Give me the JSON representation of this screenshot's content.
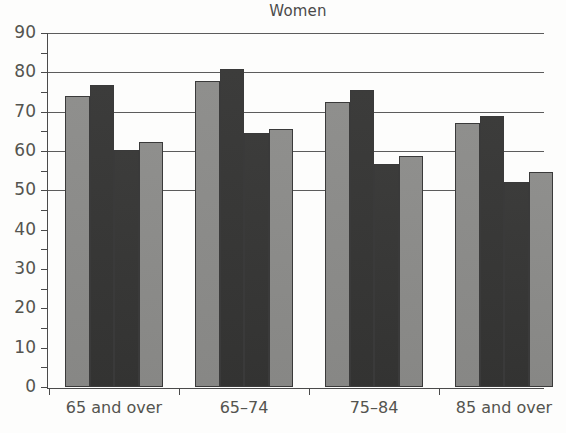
{
  "chart_data": {
    "type": "bar",
    "title": "Women",
    "xlabel": "",
    "ylabel": "",
    "ylim": [
      0,
      90
    ],
    "ytick_values": [
      0,
      10,
      20,
      30,
      40,
      50,
      60,
      70,
      80,
      90
    ],
    "ytick_labels": [
      "0",
      "10",
      "20",
      "30",
      "40",
      "50",
      "60",
      "70",
      "80",
      "90"
    ],
    "yminor_values": [
      5,
      15,
      25,
      35,
      45,
      55,
      65,
      75,
      85
    ],
    "gridlines_at": [
      50,
      60,
      70,
      80,
      90
    ],
    "grid": true,
    "legend": "none",
    "categories": [
      "65 and over",
      "65–74",
      "75–84",
      "85 and over"
    ],
    "series": [
      {
        "name": "series-1",
        "color": "#8e8e8c",
        "values": [
          74.0,
          77.8,
          72.5,
          67.0
        ]
      },
      {
        "name": "series-2",
        "color": "#3a3a39",
        "values": [
          76.8,
          80.8,
          75.5,
          68.8
        ]
      },
      {
        "name": "series-3",
        "color": "#3a3a39",
        "values": [
          60.3,
          64.5,
          56.8,
          52.2
        ]
      },
      {
        "name": "series-4",
        "color": "#8e8e8c",
        "values": [
          62.3,
          65.5,
          58.8,
          54.6
        ]
      }
    ],
    "bar_colors": [
      "#8e8e8c",
      "#3a3a39",
      "#3a3a39",
      "#8e8e8c"
    ],
    "groups": [
      {
        "category": "65 and over",
        "values": [
          74.0,
          76.8,
          60.3,
          62.3
        ]
      },
      {
        "category": "65–74",
        "values": [
          77.8,
          80.8,
          64.5,
          65.5
        ]
      },
      {
        "category": "75–84",
        "values": [
          72.5,
          75.5,
          56.8,
          58.8
        ]
      },
      {
        "category": "85 and over",
        "values": [
          67.0,
          68.8,
          52.2,
          54.6
        ]
      }
    ]
  },
  "colors": {
    "light_bar": "#8e8e8c",
    "dark_bar": "#3a3a39",
    "axis": "#4a4a4a",
    "grid": "#5c5c5c",
    "text": "#54544f",
    "background": "#fdfdfc"
  }
}
